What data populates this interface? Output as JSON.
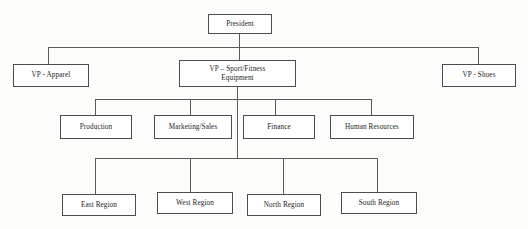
{
  "chart": {
    "type": "org-chart",
    "orientation": "top-down",
    "line_color": "#5a5a5a",
    "box_border_color": "#4d4d4d",
    "box_fill_color": "#ffffff",
    "background_color": "#fdfdfc",
    "text_color": "#1c1c1c"
  },
  "nodes": {
    "president": {
      "label": "President",
      "level": 0
    },
    "vp_apparel": {
      "label": "VP - Apparel",
      "level": 1
    },
    "vp_sport_fitness": {
      "label": "VP – Sport/Fitness\nEquipment",
      "level": 1
    },
    "vp_shoes": {
      "label": "VP - Shoes",
      "level": 1
    },
    "production": {
      "label": "Production",
      "level": 2
    },
    "marketing_sales": {
      "label": "Marketing/Sales",
      "level": 2
    },
    "finance": {
      "label": "Finance",
      "level": 2
    },
    "human_resources": {
      "label": "Human Resources",
      "level": 2
    },
    "east_region": {
      "label": "East Region",
      "level": 3
    },
    "west_region": {
      "label": "West Region",
      "level": 3
    },
    "north_region": {
      "label": "North Region",
      "level": 3
    },
    "south_region": {
      "label": "South Region",
      "level": 3
    }
  },
  "hierarchy": {
    "root": "President",
    "edges": [
      {
        "from": "President",
        "to": "VP - Apparel"
      },
      {
        "from": "President",
        "to": "VP – Sport/Fitness Equipment"
      },
      {
        "from": "President",
        "to": "VP - Shoes"
      },
      {
        "from": "VP – Sport/Fitness Equipment",
        "to": "Production"
      },
      {
        "from": "VP – Sport/Fitness Equipment",
        "to": "Marketing/Sales"
      },
      {
        "from": "VP – Sport/Fitness Equipment",
        "to": "Finance"
      },
      {
        "from": "VP – Sport/Fitness Equipment",
        "to": "Human Resources"
      },
      {
        "from": "VP – Sport/Fitness Equipment",
        "to": "East Region"
      },
      {
        "from": "VP – Sport/Fitness Equipment",
        "to": "West Region"
      },
      {
        "from": "VP – Sport/Fitness Equipment",
        "to": "North Region"
      },
      {
        "from": "VP – Sport/Fitness Equipment",
        "to": "South Region"
      }
    ]
  }
}
